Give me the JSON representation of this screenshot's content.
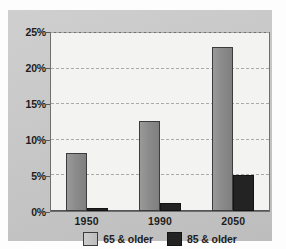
{
  "chart_data": {
    "type": "bar",
    "title": "",
    "subtitle": "",
    "xlabel": "",
    "ylabel": "",
    "categories": [
      "1950",
      "1990",
      "2050"
    ],
    "series": [
      {
        "name": "65 & older",
        "color": "#8e8e8e",
        "values": [
          8.1,
          12.7,
          23.0
        ]
      },
      {
        "name": "85 & older",
        "color": "#232323",
        "values": [
          0.4,
          1.1,
          5.0
        ]
      }
    ],
    "ylim": [
      0,
      25
    ],
    "yticks": [
      0,
      5,
      10,
      15,
      20,
      25
    ],
    "ytick_labels": [
      "0%",
      "5%",
      "10%",
      "15%",
      "20%",
      "25%"
    ],
    "grid": true,
    "grid_axis": "y",
    "legend_position": "bottom",
    "value_unit": "%"
  },
  "legend": {
    "entries": [
      {
        "label": "65 & older",
        "swatch": "legend-swatch-65-and-older"
      },
      {
        "label": "85 & older",
        "swatch": "legend-swatch-85-and-older"
      }
    ]
  },
  "colors": {
    "panel_background": "#c8c8c8",
    "plot_background": "#f3f3f1",
    "axis": "#6f6f6f",
    "gridline": "#a9a9a9",
    "series_65": "#8e8e8e",
    "series_85": "#232323",
    "text": "#1d1d1d"
  }
}
